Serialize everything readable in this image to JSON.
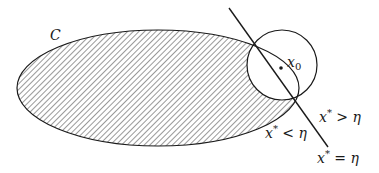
{
  "diagram": {
    "region_label": "C",
    "point_label": "x",
    "point_subscript": "0",
    "labels": [
      {
        "id": "greater",
        "var": "x",
        "sup": "*",
        "op": " > ",
        "rhs": "η"
      },
      {
        "id": "less",
        "var": "x",
        "sup": "*",
        "op": " < ",
        "rhs": "η"
      },
      {
        "id": "equal",
        "var": "x",
        "sup": "*",
        "op": " = ",
        "rhs": "η"
      }
    ],
    "colors": {
      "stroke": "#1a1a1a",
      "hatch": "#333333",
      "background": "#ffffff"
    }
  }
}
